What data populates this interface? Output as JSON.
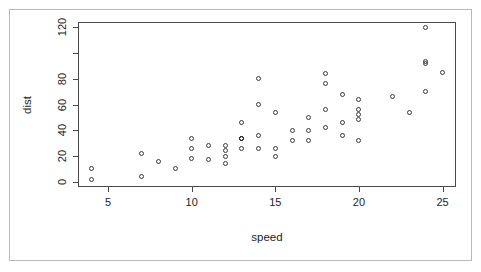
{
  "chart_data": {
    "type": "scatter",
    "title": "",
    "xlabel": "speed",
    "ylabel": "dist",
    "xlim": [
      3.2,
      25.8
    ],
    "ylim": [
      -4,
      124
    ],
    "grid": false,
    "legend": null,
    "x_ticks": [
      5,
      10,
      15,
      20,
      25
    ],
    "x_tick_labels": [
      "5",
      "10",
      "15",
      "20",
      "25"
    ],
    "y_ticks": [
      0,
      20,
      40,
      60,
      80,
      100,
      120
    ],
    "y_tick_labels": [
      "0",
      "20",
      "40",
      "60",
      "80",
      "",
      "120"
    ],
    "marker": "open-circle",
    "marker_color": "#3a3a3a",
    "n_points": 50,
    "points": [
      {
        "x": 4,
        "y": 2
      },
      {
        "x": 4,
        "y": 10
      },
      {
        "x": 7,
        "y": 4
      },
      {
        "x": 7,
        "y": 22
      },
      {
        "x": 8,
        "y": 16
      },
      {
        "x": 9,
        "y": 10
      },
      {
        "x": 10,
        "y": 18
      },
      {
        "x": 10,
        "y": 26
      },
      {
        "x": 10,
        "y": 34
      },
      {
        "x": 11,
        "y": 17
      },
      {
        "x": 11,
        "y": 28
      },
      {
        "x": 12,
        "y": 14
      },
      {
        "x": 12,
        "y": 20
      },
      {
        "x": 12,
        "y": 24
      },
      {
        "x": 12,
        "y": 28
      },
      {
        "x": 13,
        "y": 26
      },
      {
        "x": 13,
        "y": 34
      },
      {
        "x": 13,
        "y": 34
      },
      {
        "x": 13,
        "y": 46
      },
      {
        "x": 14,
        "y": 26
      },
      {
        "x": 14,
        "y": 36
      },
      {
        "x": 14,
        "y": 60
      },
      {
        "x": 14,
        "y": 80
      },
      {
        "x": 15,
        "y": 20
      },
      {
        "x": 15,
        "y": 26
      },
      {
        "x": 15,
        "y": 54
      },
      {
        "x": 16,
        "y": 32
      },
      {
        "x": 16,
        "y": 40
      },
      {
        "x": 17,
        "y": 32
      },
      {
        "x": 17,
        "y": 40
      },
      {
        "x": 17,
        "y": 50
      },
      {
        "x": 18,
        "y": 42
      },
      {
        "x": 18,
        "y": 56
      },
      {
        "x": 18,
        "y": 76
      },
      {
        "x": 18,
        "y": 84
      },
      {
        "x": 19,
        "y": 36
      },
      {
        "x": 19,
        "y": 46
      },
      {
        "x": 19,
        "y": 68
      },
      {
        "x": 20,
        "y": 32
      },
      {
        "x": 20,
        "y": 48
      },
      {
        "x": 20,
        "y": 52
      },
      {
        "x": 20,
        "y": 56
      },
      {
        "x": 20,
        "y": 64
      },
      {
        "x": 22,
        "y": 66
      },
      {
        "x": 23,
        "y": 54
      },
      {
        "x": 24,
        "y": 70
      },
      {
        "x": 24,
        "y": 92
      },
      {
        "x": 24,
        "y": 93
      },
      {
        "x": 24,
        "y": 120
      },
      {
        "x": 25,
        "y": 85
      }
    ]
  },
  "figure": {
    "background": "#ffffff",
    "frame_color": "#b9b9b9",
    "box_color": "#4a4a4a"
  }
}
